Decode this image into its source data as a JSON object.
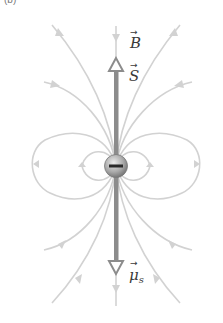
{
  "figure": {
    "corner_label": "(b)",
    "labels": {
      "B": {
        "symbol": "B",
        "vector": "→"
      },
      "S": {
        "symbol": "S",
        "vector": "→"
      },
      "mu": {
        "symbol": "μ",
        "subscript": "s",
        "vector": "→"
      }
    },
    "particle": {
      "charge_sign": "−",
      "name": "electron"
    },
    "colors": {
      "field_lines": "#cfcfcf",
      "spin_axis": "#8c8c8c",
      "particle_dark": "#6e6e6e",
      "particle_light": "#e6e6e6",
      "text": "#3a3a3a"
    }
  }
}
